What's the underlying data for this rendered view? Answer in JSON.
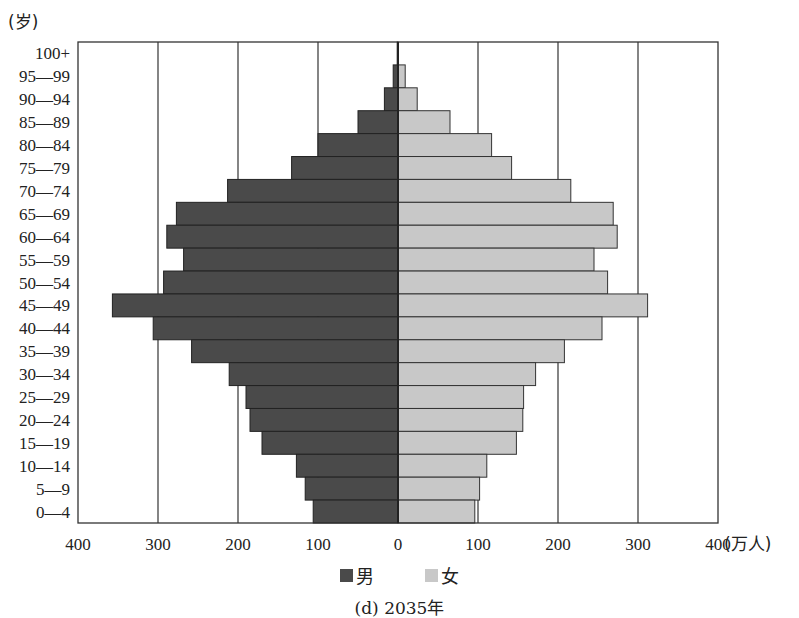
{
  "chart_data": {
    "type": "bar",
    "orientation": "horizontal-population-pyramid",
    "title": "(d) 2035年",
    "ylabel": "(岁)",
    "xlabel": "(万人)",
    "categories": [
      "100+",
      "95—99",
      "90—94",
      "85—89",
      "80—84",
      "75—79",
      "70—74",
      "65—69",
      "60—64",
      "55—59",
      "50—54",
      "45—49",
      "40—44",
      "35—39",
      "30—34",
      "25—29",
      "20—24",
      "15—19",
      "10—14",
      "5—9",
      "0—4"
    ],
    "series": [
      {
        "name": "男",
        "side": "left",
        "color": "#4a4a4a",
        "values": [
          1,
          6,
          17,
          50,
          100,
          133,
          213,
          277,
          289,
          268,
          293,
          357,
          306,
          258,
          211,
          190,
          185,
          170,
          127,
          116,
          106
        ]
      },
      {
        "name": "女",
        "side": "right",
        "color": "#c8c8c8",
        "values": [
          0,
          9,
          24,
          65,
          117,
          142,
          216,
          269,
          274,
          245,
          262,
          312,
          255,
          208,
          172,
          157,
          156,
          148,
          111,
          102,
          96
        ]
      }
    ],
    "xlim": [
      -400,
      400
    ],
    "xticks": [
      400,
      300,
      200,
      100,
      0,
      100,
      200,
      300,
      400
    ],
    "grid": true,
    "legend_position": "bottom-center"
  },
  "legend": {
    "male": "男",
    "female": "女"
  },
  "caption": "(d) 2035年",
  "axis": {
    "y_unit": "(岁)",
    "x_unit": "(万人)"
  }
}
